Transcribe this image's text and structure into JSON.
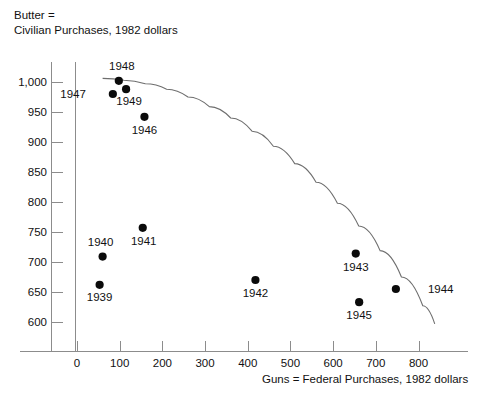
{
  "chart_data": {
    "type": "scatter",
    "title": "",
    "ylabel": "Butter =\nCivilian Purchases, 1982 dollars",
    "ylabel_line1": "Butter =",
    "ylabel_line2": "Civilian Purchases, 1982 dollars",
    "xlabel": "Guns = Federal Purchases, 1982 dollars",
    "xlim": [
      -40,
      860
    ],
    "ylim": [
      565,
      1025
    ],
    "grid": false,
    "legend": "none",
    "xticks": [
      0,
      100,
      200,
      300,
      400,
      500,
      600,
      700,
      800
    ],
    "xtick_labels": [
      "0",
      "100",
      "200",
      "300",
      "400",
      "500",
      "600",
      "700",
      "800"
    ],
    "yticks": [
      600,
      650,
      700,
      750,
      800,
      850,
      900,
      950,
      1000
    ],
    "ytick_labels": [
      "600",
      "650",
      "700",
      "750",
      "800",
      "850",
      "900",
      "950",
      "1,000"
    ],
    "points": [
      {
        "label": "1939",
        "x": 53,
        "y": 662,
        "label_dx": 0,
        "label_dy": 16
      },
      {
        "label": "1940",
        "x": 60,
        "y": 709,
        "label_dx": -2,
        "label_dy": -11
      },
      {
        "label": "1941",
        "x": 154,
        "y": 757,
        "label_dx": 1,
        "label_dy": 17
      },
      {
        "label": "1942",
        "x": 418,
        "y": 670,
        "label_dx": 0,
        "label_dy": 17
      },
      {
        "label": "1943",
        "x": 653,
        "y": 714,
        "label_dx": 0,
        "label_dy": 17
      },
      {
        "label": "1944",
        "x": 747,
        "y": 655,
        "label_dx": 32,
        "label_dy": 4
      },
      {
        "label": "1945",
        "x": 661,
        "y": 633,
        "label_dx": 0,
        "label_dy": 17
      },
      {
        "label": "1946",
        "x": 158,
        "y": 942,
        "label_dx": 0,
        "label_dy": 17
      },
      {
        "label": "1947",
        "x": 84,
        "y": 980,
        "label_dx": -27,
        "label_dy": 4
      },
      {
        "label": "1948",
        "x": 98,
        "y": 1002,
        "label_dx": 3,
        "label_dy": -11
      },
      {
        "label": "1949",
        "x": 115,
        "y": 988,
        "label_dx": 3,
        "label_dy": 16
      }
    ],
    "curve": {
      "name": "production-possibilities-frontier",
      "points": [
        [
          60,
          1006
        ],
        [
          110,
          1003
        ],
        [
          160,
          997
        ],
        [
          210,
          988
        ],
        [
          260,
          975
        ],
        [
          310,
          959
        ],
        [
          360,
          940
        ],
        [
          410,
          918
        ],
        [
          460,
          893
        ],
        [
          510,
          864
        ],
        [
          560,
          833
        ],
        [
          610,
          798
        ],
        [
          660,
          760
        ],
        [
          710,
          719
        ],
        [
          760,
          675
        ],
        [
          810,
          627
        ],
        [
          838,
          597
        ]
      ]
    }
  }
}
